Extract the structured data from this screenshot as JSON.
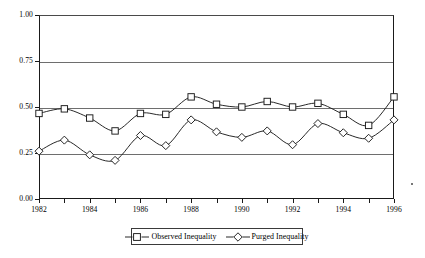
{
  "chart_data": {
    "type": "line",
    "title": "",
    "subtitle": "",
    "xlabel": "",
    "ylabel": "",
    "x": [
      1982,
      1983,
      1984,
      1985,
      1986,
      1987,
      1988,
      1989,
      1990,
      1991,
      1992,
      1993,
      1994,
      1995,
      1996
    ],
    "categories": [
      "1982",
      "1983",
      "1984",
      "1985",
      "1986",
      "1987",
      "1988",
      "1989",
      "1990",
      "1991",
      "1992",
      "1993",
      "1994",
      "1995",
      "1996"
    ],
    "series": [
      {
        "name": "Observed Inequality",
        "marker": "square",
        "values": [
          0.465,
          0.49,
          0.44,
          0.37,
          0.465,
          0.46,
          0.555,
          0.515,
          0.5,
          0.53,
          0.5,
          0.52,
          0.46,
          0.4,
          0.555
        ]
      },
      {
        "name": "Purged Inequality",
        "marker": "diamond",
        "values": [
          0.26,
          0.32,
          0.24,
          0.21,
          0.345,
          0.29,
          0.43,
          0.365,
          0.335,
          0.37,
          0.295,
          0.41,
          0.36,
          0.33,
          0.43
        ]
      }
    ],
    "xlim": [
      1982,
      1996
    ],
    "ylim": [
      0.0,
      1.0
    ],
    "y_ticks": [
      0.0,
      0.25,
      0.5,
      0.75,
      1.0
    ],
    "y_tick_labels": [
      "0.00",
      "0.25",
      "0.50",
      "0.75",
      "1.00"
    ],
    "x_tick_labels": [
      "1982",
      "1984",
      "1986",
      "1988",
      "1990",
      "1992",
      "1994",
      "1996"
    ],
    "x_tick_label_years": [
      1982,
      1984,
      1986,
      1988,
      1990,
      1992,
      1994,
      1996
    ],
    "x_minor_tick_years": [
      1983,
      1985,
      1987,
      1989,
      1991,
      1993,
      1995
    ],
    "grid": "horizontal",
    "legend_position": "bottom-center",
    "colors": {
      "line": "#1d1d1d",
      "grid": "#6e6e6e",
      "axis": "#1a1a1a",
      "marker_fill": "#ffffff",
      "background": "#ffffff"
    }
  },
  "axis": {
    "y_labels": [
      "1.00",
      "0.75",
      "0.50",
      "0.25",
      "0.00"
    ],
    "x_labels": [
      "1982",
      "1984",
      "1986",
      "1988",
      "1990",
      "1992",
      "1994",
      "1996"
    ]
  },
  "legend": {
    "entries": [
      {
        "label": "Observed Inequality",
        "marker": "square"
      },
      {
        "label": "Purged Inequality",
        "marker": "diamond"
      }
    ]
  }
}
